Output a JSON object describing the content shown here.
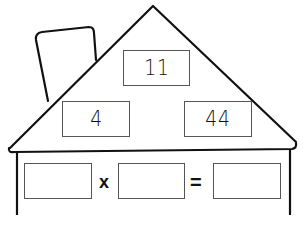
{
  "worksheet": {
    "type": "fact family house",
    "roof": {
      "top_number": "11",
      "left_number": "4",
      "right_number": "44"
    },
    "equation": {
      "operand1": "",
      "operator": "x",
      "operand2": "",
      "equals": "=",
      "result": ""
    }
  },
  "colors": {
    "line": "#111111",
    "box_border": "#555555",
    "background": "#ffffff"
  }
}
